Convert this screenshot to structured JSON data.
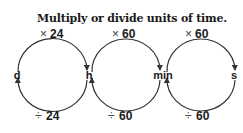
{
  "title": "Multiply or divide units of time.",
  "units": [
    {
      "label": "d"
    },
    {
      "label": "h"
    },
    {
      "label": "min"
    },
    {
      "label": "s"
    }
  ],
  "conversions": [
    {
      "from": "d",
      "to": "h",
      "multiply_symbol": "×",
      "multiply_value": "24",
      "divide_symbol": "÷",
      "divide_value": "24"
    },
    {
      "from": "h",
      "to": "min",
      "multiply_symbol": "×",
      "multiply_value": "60",
      "divide_symbol": "÷",
      "divide_value": "60"
    },
    {
      "from": "min",
      "to": "s",
      "multiply_symbol": "×",
      "multiply_value": "60",
      "divide_symbol": "÷",
      "divide_value": "60"
    }
  ],
  "colors": {
    "stroke": "#333333",
    "text": "#1a1a1a"
  }
}
